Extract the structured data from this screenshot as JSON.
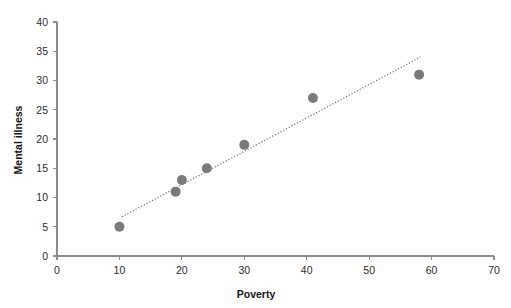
{
  "chart_data": {
    "type": "scatter",
    "title": "",
    "xlabel": "Poverty",
    "ylabel": "Mental illness",
    "xlim": [
      0,
      70
    ],
    "ylim": [
      0,
      40
    ],
    "xticks": [
      0,
      10,
      20,
      30,
      40,
      50,
      60,
      70
    ],
    "yticks": [
      0,
      5,
      10,
      15,
      20,
      25,
      30,
      35,
      40
    ],
    "grid": false,
    "legend": null,
    "point_color": "#7a7a7a",
    "trendline_color": "#6e6e6e",
    "axis_color": "#8b8b8b",
    "points": [
      {
        "x": 10,
        "y": 5
      },
      {
        "x": 19,
        "y": 11
      },
      {
        "x": 20,
        "y": 13
      },
      {
        "x": 24,
        "y": 15
      },
      {
        "x": 30,
        "y": 19
      },
      {
        "x": 41,
        "y": 27
      },
      {
        "x": 58,
        "y": 31
      }
    ],
    "series": [
      {
        "name": "Mental illness vs Poverty",
        "x": [
          10,
          19,
          20,
          24,
          30,
          41,
          58
        ],
        "values": [
          5,
          11,
          13,
          15,
          19,
          27,
          31
        ]
      }
    ],
    "trendline": {
      "type": "linear-fit",
      "style": "dotted",
      "x_start": 10.4,
      "y_start": 6.7,
      "x_end": 58.2,
      "y_end": 34.0
    }
  },
  "axes": {
    "x_title": "Poverty",
    "y_title": "Mental illness",
    "x_tick_labels": [
      "0",
      "10",
      "20",
      "30",
      "40",
      "50",
      "60",
      "70"
    ],
    "y_tick_labels": [
      "0",
      "5",
      "10",
      "15",
      "20",
      "25",
      "30",
      "35",
      "40"
    ]
  }
}
